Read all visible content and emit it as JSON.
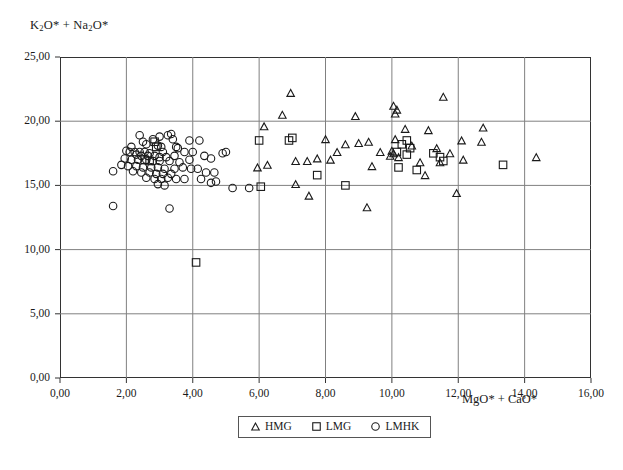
{
  "chart_data": {
    "type": "scatter",
    "title": "",
    "xlabel": "MgO* + CaO*",
    "ylabel": "K2O* + Na2O*",
    "xlabel_html": "MgO* + CaO*",
    "ylabel_html": "K<sub>2</sub>O* + Na<sub>2</sub>O*",
    "xlim": [
      0,
      16
    ],
    "ylim": [
      0,
      25
    ],
    "xticks": [
      0,
      2,
      4,
      6,
      8,
      10,
      12,
      14,
      16
    ],
    "yticks": [
      0,
      5,
      10,
      15,
      20,
      25
    ],
    "xtick_labels": [
      "0,00",
      "2,00",
      "4,00",
      "6,00",
      "8,00",
      "10,00",
      "12,00",
      "14,00",
      "16,00"
    ],
    "ytick_labels": [
      "0,00",
      "5,00",
      "10,00",
      "15,00",
      "20,00",
      "25,00"
    ],
    "decimal_separator": ",",
    "grid": true,
    "grid_color": "#808080",
    "frame_color": "#333333",
    "legend_position": "bottom-center",
    "marker_color": "#1a1a1a",
    "series": [
      {
        "name": "HMG",
        "marker": "triangle",
        "points": [
          [
            6.95,
            22.2
          ],
          [
            11.55,
            21.9
          ],
          [
            10.05,
            21.2
          ],
          [
            10.15,
            20.9
          ],
          [
            10.1,
            20.6
          ],
          [
            6.7,
            20.5
          ],
          [
            8.9,
            20.4
          ],
          [
            6.15,
            19.6
          ],
          [
            12.75,
            19.5
          ],
          [
            10.4,
            19.4
          ],
          [
            11.1,
            19.3
          ],
          [
            8.0,
            18.6
          ],
          [
            10.1,
            18.6
          ],
          [
            12.1,
            18.5
          ],
          [
            12.7,
            18.4
          ],
          [
            9.3,
            18.4
          ],
          [
            9.0,
            18.3
          ],
          [
            8.6,
            18.2
          ],
          [
            10.6,
            18.1
          ],
          [
            11.35,
            17.9
          ],
          [
            10.0,
            17.7
          ],
          [
            10.05,
            17.5
          ],
          [
            8.35,
            17.6
          ],
          [
            9.65,
            17.6
          ],
          [
            11.75,
            17.5
          ],
          [
            9.95,
            17.3
          ],
          [
            10.2,
            17.2
          ],
          [
            14.35,
            17.2
          ],
          [
            12.15,
            17.0
          ],
          [
            7.75,
            17.1
          ],
          [
            8.15,
            17.0
          ],
          [
            7.45,
            16.9
          ],
          [
            7.1,
            16.9
          ],
          [
            10.85,
            16.8
          ],
          [
            11.45,
            16.8
          ],
          [
            6.25,
            16.6
          ],
          [
            5.95,
            16.4
          ],
          [
            9.4,
            16.5
          ],
          [
            11.0,
            15.8
          ],
          [
            7.1,
            15.1
          ],
          [
            11.95,
            14.4
          ],
          [
            7.5,
            14.2
          ],
          [
            9.25,
            13.3
          ]
        ]
      },
      {
        "name": "LMG",
        "marker": "square",
        "points": [
          [
            6.0,
            18.5
          ],
          [
            6.9,
            18.5
          ],
          [
            7.0,
            18.7
          ],
          [
            10.45,
            18.5
          ],
          [
            10.3,
            18.2
          ],
          [
            10.55,
            17.9
          ],
          [
            10.15,
            17.6
          ],
          [
            11.25,
            17.5
          ],
          [
            10.45,
            17.4
          ],
          [
            11.45,
            17.2
          ],
          [
            11.55,
            16.9
          ],
          [
            10.2,
            16.4
          ],
          [
            10.75,
            16.2
          ],
          [
            7.75,
            15.8
          ],
          [
            6.05,
            14.9
          ],
          [
            8.6,
            15.0
          ],
          [
            13.35,
            16.6
          ],
          [
            4.1,
            9.0
          ],
          [
            2.85,
            18.4
          ],
          [
            2.9,
            18.0
          ],
          [
            2.55,
            17.0
          ],
          [
            2.7,
            16.9
          ]
        ]
      },
      {
        "name": "LMHK",
        "marker": "circle",
        "points": [
          [
            3.35,
            19.0
          ],
          [
            3.25,
            18.9
          ],
          [
            3.4,
            18.6
          ],
          [
            2.8,
            18.6
          ],
          [
            3.9,
            18.5
          ],
          [
            4.2,
            18.5
          ],
          [
            2.5,
            18.4
          ],
          [
            2.6,
            18.2
          ],
          [
            2.95,
            18.1
          ],
          [
            3.05,
            18.0
          ],
          [
            3.5,
            18.0
          ],
          [
            3.55,
            17.9
          ],
          [
            2.0,
            17.7
          ],
          [
            2.1,
            17.6
          ],
          [
            2.25,
            17.6
          ],
          [
            2.4,
            17.6
          ],
          [
            2.55,
            17.6
          ],
          [
            2.7,
            17.5
          ],
          [
            3.1,
            17.6
          ],
          [
            3.75,
            17.6
          ],
          [
            4.0,
            17.6
          ],
          [
            4.9,
            17.5
          ],
          [
            5.0,
            17.6
          ],
          [
            2.3,
            17.4
          ],
          [
            2.45,
            17.3
          ],
          [
            2.65,
            17.3
          ],
          [
            2.85,
            17.3
          ],
          [
            3.0,
            17.2
          ],
          [
            3.2,
            17.2
          ],
          [
            3.45,
            17.3
          ],
          [
            4.35,
            17.3
          ],
          [
            4.55,
            17.1
          ],
          [
            1.95,
            17.1
          ],
          [
            2.15,
            17.0
          ],
          [
            2.35,
            17.0
          ],
          [
            2.6,
            17.0
          ],
          [
            2.8,
            16.9
          ],
          [
            3.0,
            16.9
          ],
          [
            3.3,
            16.9
          ],
          [
            3.6,
            16.8
          ],
          [
            1.85,
            16.6
          ],
          [
            2.05,
            16.5
          ],
          [
            2.3,
            16.5
          ],
          [
            2.5,
            16.4
          ],
          [
            2.75,
            16.4
          ],
          [
            2.95,
            16.4
          ],
          [
            3.15,
            16.3
          ],
          [
            3.45,
            16.3
          ],
          [
            3.7,
            16.4
          ],
          [
            3.95,
            16.3
          ],
          [
            4.15,
            16.3
          ],
          [
            2.2,
            16.1
          ],
          [
            2.45,
            16.0
          ],
          [
            2.7,
            16.0
          ],
          [
            2.9,
            15.9
          ],
          [
            3.1,
            15.9
          ],
          [
            3.35,
            15.9
          ],
          [
            4.4,
            16.0
          ],
          [
            4.65,
            16.0
          ],
          [
            1.6,
            16.1
          ],
          [
            2.6,
            15.6
          ],
          [
            2.85,
            15.5
          ],
          [
            3.05,
            15.5
          ],
          [
            3.25,
            15.6
          ],
          [
            3.5,
            15.5
          ],
          [
            3.75,
            15.5
          ],
          [
            4.25,
            15.5
          ],
          [
            2.95,
            15.1
          ],
          [
            3.15,
            15.0
          ],
          [
            4.55,
            15.2
          ],
          [
            4.7,
            15.3
          ],
          [
            5.2,
            14.8
          ],
          [
            5.7,
            14.8
          ],
          [
            1.6,
            13.4
          ],
          [
            3.3,
            13.2
          ],
          [
            2.4,
            18.9
          ],
          [
            3.0,
            18.8
          ],
          [
            2.15,
            18.0
          ],
          [
            3.9,
            17.0
          ]
        ]
      }
    ]
  },
  "legend": {
    "entries": [
      {
        "label": "HMG",
        "marker": "triangle"
      },
      {
        "label": "LMG",
        "marker": "square"
      },
      {
        "label": "LMHK",
        "marker": "circle"
      }
    ]
  }
}
